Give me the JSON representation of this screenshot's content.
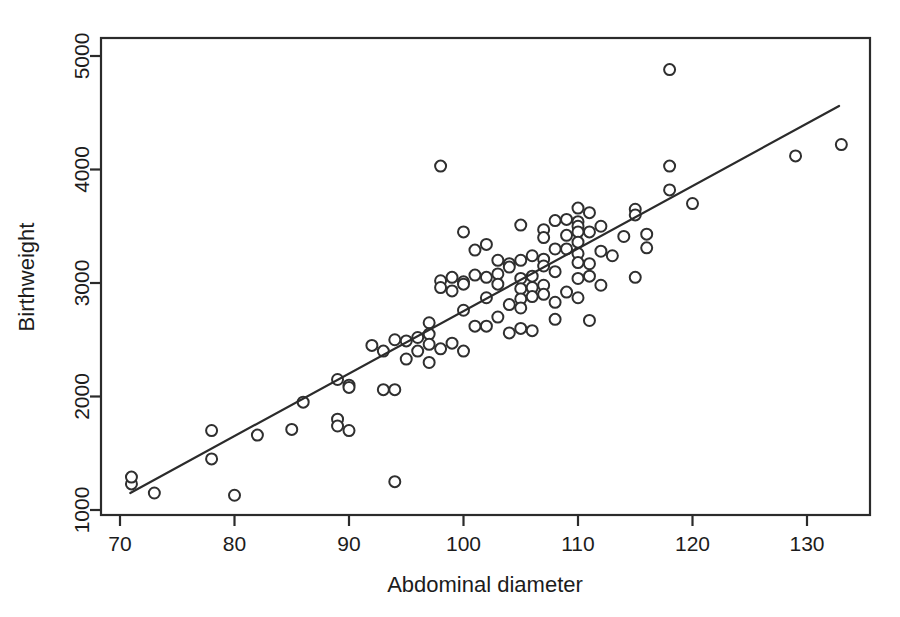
{
  "chart_data": {
    "type": "scatter",
    "title": "",
    "xlabel": "Abdominal diameter",
    "ylabel": "Birthweight",
    "xlim": [
      68.3,
      135.5
    ],
    "ylim": [
      780,
      5200
    ],
    "xticks": [
      70,
      80,
      90,
      100,
      110,
      120,
      130
    ],
    "yticks": [
      1000,
      2000,
      3000,
      4000,
      5000
    ],
    "xtick_labels": [
      "70",
      "80",
      "90",
      "100",
      "110",
      "120",
      "130"
    ],
    "ytick_labels": [
      "1000",
      "2000",
      "3000",
      "4000",
      "5000"
    ],
    "grid": false,
    "legend": "none",
    "marker": "open-circle",
    "marker_size": 11,
    "series": [
      {
        "name": "Birthweight vs abdominal diameter",
        "x": [
          71,
          71,
          73,
          78,
          78,
          80,
          82,
          85,
          86,
          89,
          89,
          89,
          90,
          90,
          90,
          92,
          93,
          93,
          94,
          94,
          94,
          95,
          95,
          96,
          96,
          97,
          97,
          97,
          97,
          98,
          98,
          98,
          98,
          99,
          99,
          99,
          100,
          100,
          100,
          100,
          100,
          101,
          101,
          101,
          102,
          102,
          102,
          102,
          103,
          103,
          103,
          103,
          104,
          104,
          104,
          104,
          105,
          105,
          105,
          105,
          105,
          105,
          105,
          106,
          106,
          106,
          106,
          106,
          107,
          107,
          107,
          107,
          107,
          107,
          108,
          108,
          108,
          108,
          108,
          109,
          109,
          109,
          109,
          110,
          110,
          110,
          110,
          110,
          110,
          110,
          110,
          110,
          111,
          111,
          111,
          111,
          111,
          112,
          112,
          112,
          113,
          114,
          115,
          115,
          115,
          116,
          116,
          118,
          118,
          118,
          120,
          129,
          133
        ],
        "y": [
          1230,
          1290,
          1150,
          1700,
          1450,
          1130,
          1660,
          1710,
          1950,
          2150,
          1800,
          1740,
          2100,
          2080,
          1700,
          2450,
          2400,
          2060,
          2500,
          2060,
          1250,
          2490,
          2330,
          2520,
          2400,
          2650,
          2550,
          2460,
          2300,
          4030,
          3020,
          2960,
          2420,
          3050,
          2930,
          2470,
          3450,
          3010,
          2990,
          2760,
          2400,
          3290,
          3070,
          2620,
          3340,
          3050,
          2870,
          2620,
          3200,
          3080,
          2990,
          2700,
          3170,
          3140,
          2810,
          2560,
          3510,
          3200,
          3040,
          2950,
          2860,
          2780,
          2600,
          3240,
          3060,
          2960,
          2880,
          2580,
          3470,
          3400,
          3210,
          3150,
          2980,
          2900,
          3550,
          3300,
          3100,
          2830,
          2680,
          3560,
          3420,
          3300,
          2920,
          3660,
          3540,
          3500,
          3450,
          3360,
          3260,
          3180,
          3040,
          2870,
          3620,
          3450,
          3170,
          3060,
          2670,
          3500,
          3280,
          2980,
          3240,
          3410,
          3650,
          3600,
          3050,
          3430,
          3310,
          4880,
          4030,
          3820,
          3700,
          4120,
          4220
        ]
      }
    ],
    "fit_line": {
      "name": "least-squares fit",
      "x_start": 70.9,
      "y_start": 1150,
      "x_end": 132.8,
      "y_end": 4560
    }
  },
  "axes": {
    "x_axis_name": "Abdominal diameter",
    "y_axis_name": "Birthweight"
  }
}
